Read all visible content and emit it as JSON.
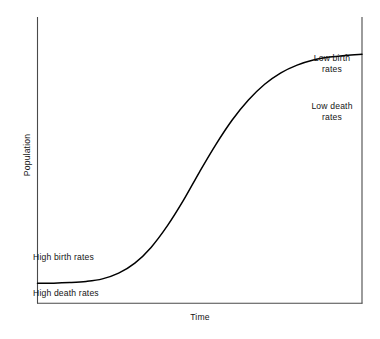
{
  "chart_data": {
    "type": "line",
    "title": "",
    "subtitle": "",
    "xlabel": "Time",
    "ylabel": "Population",
    "grid": false,
    "legend": "none",
    "axis_style": "left-and-right-spines-with-bottom-axis",
    "xlim": [
      0,
      100
    ],
    "ylim": [
      0,
      100
    ],
    "xticks": [],
    "yticks": [],
    "series": [
      {
        "name": "Demographic transition S-curve",
        "shape": "logistic",
        "x": [
          0,
          5,
          10,
          15,
          20,
          25,
          30,
          35,
          40,
          45,
          50,
          55,
          60,
          65,
          70,
          75,
          80,
          85,
          90,
          95,
          100
        ],
        "y": [
          7,
          7,
          7.2,
          7.6,
          8.5,
          10.5,
          14,
          19.5,
          27,
          36,
          46,
          55.5,
          64,
          71,
          76.5,
          80.5,
          83.2,
          85,
          86,
          86.6,
          87
        ]
      }
    ],
    "annotations": [
      {
        "id": "high-birth-rates",
        "text": "High birth rates",
        "position": "lower-left-above-curve",
        "align": "left",
        "x_px": 33,
        "y_px": 252
      },
      {
        "id": "high-death-rates",
        "text": "High death rates",
        "position": "lower-left-below-curve",
        "align": "left",
        "x_px": 33,
        "y_px": 288
      },
      {
        "id": "low-birth-rates",
        "text": "Low birth\nrates",
        "position": "upper-right-above-curve",
        "align": "center",
        "x_px": 303,
        "y_px": 53
      },
      {
        "id": "low-death-rates",
        "text": "Low death\nrates",
        "position": "upper-right-below-curve",
        "align": "center",
        "x_px": 303,
        "y_px": 101
      }
    ],
    "colors": {
      "background": "#ffffff",
      "curve": "#000000",
      "axis": "#3c3c3c",
      "text": "#141414"
    }
  },
  "figure": {
    "axis_label_y": "Population",
    "axis_label_x": "Time",
    "annotation_high_birth": "High birth rates",
    "annotation_high_death": "High death rates",
    "annotation_low_birth": "Low birth\nrates",
    "annotation_low_death": "Low death\nrates"
  }
}
